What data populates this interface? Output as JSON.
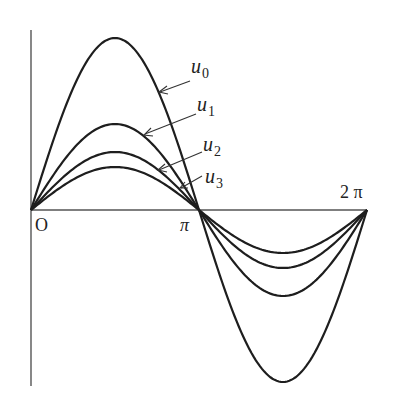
{
  "figure": {
    "type": "function-plot",
    "colors": {
      "curve": "#1e1e1e",
      "axis": "#555555",
      "text": "#222222",
      "background": "#ffffff"
    }
  },
  "axes": {
    "origin_label": "O",
    "x_ticks": [
      {
        "label": "π",
        "value": 3.14159
      },
      {
        "label": "2 π",
        "value": 6.28319
      }
    ]
  },
  "curves": [
    {
      "name": "u",
      "subscript": "0",
      "amplitude": 1.0
    },
    {
      "name": "u",
      "subscript": "1",
      "amplitude": 0.5
    },
    {
      "name": "u",
      "subscript": "2",
      "amplitude": 0.337
    },
    {
      "name": "u",
      "subscript": "3",
      "amplitude": 0.25
    }
  ],
  "chart_data": {
    "type": "line",
    "title": "",
    "xlabel": "",
    "ylabel": "",
    "x_range": [
      0,
      6.28319
    ],
    "x_tick_labels": [
      "O",
      "π",
      "2 π"
    ],
    "series": [
      {
        "name": "u0",
        "shape": "sin(x)",
        "amplitude": 1.0
      },
      {
        "name": "u1",
        "shape": "sin(x)",
        "amplitude": 0.5
      },
      {
        "name": "u2",
        "shape": "sin(x)",
        "amplitude": 0.337
      },
      {
        "name": "u3",
        "shape": "sin(x)",
        "amplitude": 0.25
      }
    ],
    "grid": false,
    "legend": "arrow-annotations"
  }
}
